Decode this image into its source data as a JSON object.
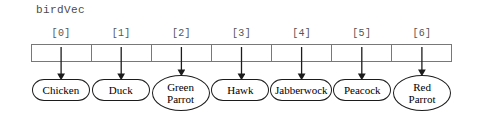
{
  "diagram": {
    "type": "array-of-pointers",
    "variable_label": "birdVec",
    "index_labels": [
      "[0]",
      "[1]",
      "[2]",
      "[3]",
      "[4]",
      "[5]",
      "[6]"
    ],
    "cell_count": 7,
    "colors": {
      "box_stroke": "#787878",
      "oval_stroke": "#1c1c1c",
      "arrow": "#1c1c1c",
      "label_text": "#4a4a4a",
      "index_text": "#555555",
      "oval_text": "#000000",
      "background": "#ffffff"
    },
    "elements": [
      {
        "index": "[0]",
        "lines": [
          "Chicken"
        ],
        "value": "Chicken"
      },
      {
        "index": "[1]",
        "lines": [
          "Duck"
        ],
        "value": "Duck"
      },
      {
        "index": "[2]",
        "lines": [
          "Green",
          "Parrot"
        ],
        "value": "Green Parrot"
      },
      {
        "index": "[3]",
        "lines": [
          "Hawk"
        ],
        "value": "Hawk"
      },
      {
        "index": "[4]",
        "lines": [
          "Jabberwock"
        ],
        "value": "Jabberwock"
      },
      {
        "index": "[5]",
        "lines": [
          "Peacock"
        ],
        "value": "Peacock"
      },
      {
        "index": "[6]",
        "lines": [
          "Red",
          "Parrot"
        ],
        "value": "Red Parrot"
      }
    ]
  }
}
